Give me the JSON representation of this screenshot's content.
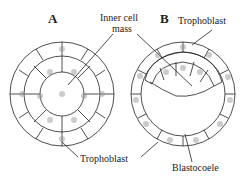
{
  "figure": {
    "panels": [
      {
        "id": "A",
        "label": "A"
      },
      {
        "id": "B",
        "label": "B"
      }
    ],
    "labels": {
      "inner_cell_mass_line1": "Inner cell",
      "inner_cell_mass_line2": "mass",
      "trophoblast_top": "Trophoblast",
      "trophoblast_bottom": "Trophoblast",
      "blastocoele": "Blastocoele"
    }
  }
}
